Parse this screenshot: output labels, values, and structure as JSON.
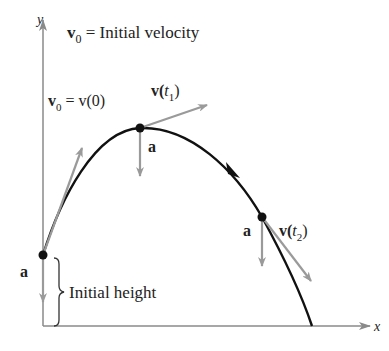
{
  "title": "v0 = Initial velocity",
  "title_parts": {
    "v": "v",
    "sub": "0",
    "rest": " = Initial velocity"
  },
  "axes": {
    "x_label": "x",
    "y_label": "y"
  },
  "labels": {
    "v0_eq": {
      "v": "v",
      "sub": "0",
      "rest": " = v(0)"
    },
    "vt1": {
      "pre": "v(",
      "t": "t",
      "sub": "1",
      "post": ")"
    },
    "vt2": {
      "pre": "v(",
      "t": "t",
      "sub": "2",
      "post": ")"
    },
    "accel": "a",
    "initial_height": "Initial height"
  },
  "colors": {
    "curve": "#111111",
    "vectors": "#9a9a9a",
    "axes": "#8a8a8a",
    "points": "#111111"
  }
}
